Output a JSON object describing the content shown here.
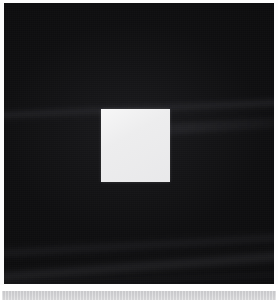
{
  "image": {
    "kind": "photograph",
    "description": "Bright off-white square centered on a near-black background",
    "width": 278,
    "height": 300,
    "background_color": "#0b0b0c",
    "subject_color": "#ececed",
    "border_color": "#ffffff",
    "bottom_band_color": "#d0d0d2",
    "alt_text": "A small luminous white square floating at the center of a large dark, nearly black field."
  },
  "regions": {
    "dark_field": {
      "name": "dark background field",
      "color": "#0b0b0c",
      "x": 4,
      "y": 3,
      "width": 270,
      "height": 281
    },
    "bright_square": {
      "name": "bright square subject",
      "color": "#ececed",
      "x": 101,
      "y": 109,
      "width": 69,
      "height": 73
    },
    "bottom_gap": {
      "name": "white separator gap",
      "color": "#ffffff",
      "x": 0,
      "y": 284,
      "width": 278,
      "height": 7
    },
    "bottom_band": {
      "name": "light gray bottom band",
      "color": "#d0d0d2",
      "x": 2,
      "y": 291,
      "width": 274,
      "height": 9
    }
  },
  "streaks": [
    {
      "name": "upper diagonal streak",
      "y": 100,
      "angle_deg": -2.6
    },
    {
      "name": "upper right diagonal streak",
      "y": 118,
      "angle_deg": -3.4
    },
    {
      "name": "lower diagonal streak a",
      "y": 236,
      "angle_deg": -3.2
    },
    {
      "name": "lower diagonal streak b",
      "y": 256,
      "angle_deg": -4.2
    },
    {
      "name": "lower diagonal streak c",
      "y": 272,
      "angle_deg": -2.2
    }
  ]
}
